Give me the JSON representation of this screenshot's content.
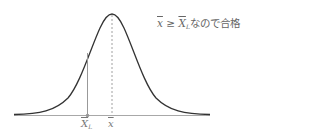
{
  "diagram": {
    "type": "normal-distribution",
    "annotation": {
      "var_x": "x",
      "operator": "≥",
      "var_XL": "X",
      "var_XL_sub": "L",
      "suffix": "なので合格"
    },
    "labels": {
      "lower_limit": "X",
      "lower_limit_sub": "L",
      "mean": "x"
    },
    "colors": {
      "curve": "#333333",
      "axis": "#999999",
      "lower_limit_line": "#999999",
      "mean_line": "#888888",
      "text": "#666666"
    }
  }
}
